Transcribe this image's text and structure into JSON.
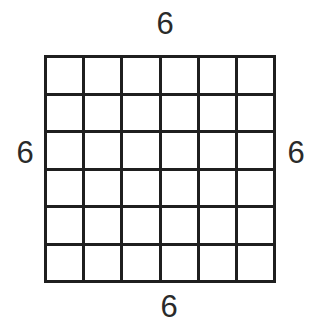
{
  "figure": {
    "grid": {
      "rows": 6,
      "cols": 6
    },
    "labels": {
      "top": "6",
      "bottom": "6",
      "left": "6",
      "right": "6"
    },
    "colors": {
      "line": "#1f1f1f",
      "background": "#ffffff",
      "label_text": "#2a2a2a"
    }
  }
}
